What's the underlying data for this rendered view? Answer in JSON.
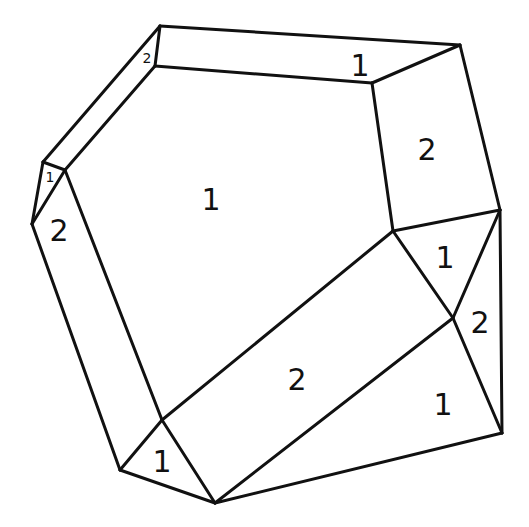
{
  "diagram": {
    "stroke_color": "#111111",
    "background_color": "#ffffff",
    "vertices": {
      "A": [
        160,
        26
      ],
      "B": [
        460,
        45
      ],
      "C": [
        155,
        66
      ],
      "D": [
        372,
        83
      ],
      "E": [
        43,
        162
      ],
      "F": [
        65,
        170
      ],
      "G": [
        32,
        224
      ],
      "H": [
        500,
        210
      ],
      "I": [
        393,
        231
      ],
      "J": [
        453,
        318
      ],
      "K": [
        162,
        420
      ],
      "L": [
        120,
        470
      ],
      "M": [
        502,
        433
      ],
      "N": [
        215,
        503
      ]
    },
    "edges": [
      [
        "A",
        "B"
      ],
      [
        "C",
        "D"
      ],
      [
        "A",
        "C"
      ],
      [
        "B",
        "D"
      ],
      [
        "A",
        "E"
      ],
      [
        "C",
        "F"
      ],
      [
        "E",
        "F"
      ],
      [
        "E",
        "G"
      ],
      [
        "F",
        "G"
      ],
      [
        "B",
        "H"
      ],
      [
        "D",
        "I"
      ],
      [
        "I",
        "H"
      ],
      [
        "H",
        "M"
      ],
      [
        "H",
        "J"
      ],
      [
        "I",
        "J"
      ],
      [
        "J",
        "M"
      ],
      [
        "G",
        "L"
      ],
      [
        "F",
        "K"
      ],
      [
        "K",
        "L"
      ],
      [
        "I",
        "K"
      ],
      [
        "J",
        "N"
      ],
      [
        "K",
        "N"
      ],
      [
        "L",
        "N"
      ],
      [
        "N",
        "M"
      ]
    ],
    "face_labels": [
      {
        "text": "2",
        "x": 147,
        "y": 58,
        "size": 14
      },
      {
        "text": "1",
        "x": 360,
        "y": 66,
        "size": 30
      },
      {
        "text": "1",
        "x": 50,
        "y": 177,
        "size": 14
      },
      {
        "text": "2",
        "x": 59,
        "y": 231,
        "size": 30
      },
      {
        "text": "1",
        "x": 211,
        "y": 200,
        "size": 30
      },
      {
        "text": "2",
        "x": 427,
        "y": 150,
        "size": 30
      },
      {
        "text": "1",
        "x": 445,
        "y": 258,
        "size": 30
      },
      {
        "text": "2",
        "x": 480,
        "y": 323,
        "size": 30
      },
      {
        "text": "2",
        "x": 297,
        "y": 380,
        "size": 30
      },
      {
        "text": "1",
        "x": 443,
        "y": 405,
        "size": 30
      },
      {
        "text": "1",
        "x": 162,
        "y": 462,
        "size": 30
      }
    ]
  }
}
